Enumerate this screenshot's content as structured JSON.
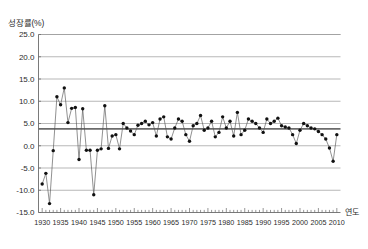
{
  "chart_data": {
    "type": "line",
    "title": "",
    "ylabel": "성장률(%)",
    "xlabel": "연도",
    "ylim": [
      -15.0,
      25.0
    ],
    "xlim": [
      1929,
      2011
    ],
    "grid": true,
    "legend": false,
    "yticks": [
      "25.0",
      "20.0",
      "15.0",
      "10.0",
      "5.0",
      "0.0",
      "-5.0",
      "-10.0",
      "-15.0"
    ],
    "ytick_values": [
      25.0,
      20.0,
      15.0,
      10.0,
      5.0,
      0.0,
      -5.0,
      -10.0,
      -15.0
    ],
    "xticks": [
      "1930",
      "1935",
      "1940",
      "1945",
      "1950",
      "1955",
      "1960",
      "1965",
      "1970",
      "1975",
      "1980",
      "1985",
      "1990",
      "1995",
      "2000",
      "2005",
      "2010"
    ],
    "xtick_values": [
      1930,
      1935,
      1940,
      1945,
      1950,
      1955,
      1960,
      1965,
      1970,
      1975,
      1980,
      1985,
      1990,
      1995,
      2000,
      2005,
      2010
    ],
    "reference_line": {
      "value": 3.8,
      "label": ""
    },
    "marker": "filled-circle",
    "series": [
      {
        "name": "성장률",
        "color": "#111111",
        "x": [
          1930,
          1931,
          1932,
          1933,
          1934,
          1935,
          1936,
          1937,
          1938,
          1939,
          1940,
          1941,
          1942,
          1943,
          1944,
          1945,
          1946,
          1947,
          1948,
          1949,
          1950,
          1951,
          1952,
          1953,
          1954,
          1955,
          1956,
          1957,
          1958,
          1959,
          1960,
          1961,
          1962,
          1963,
          1964,
          1965,
          1966,
          1967,
          1968,
          1969,
          1970,
          1971,
          1972,
          1973,
          1974,
          1975,
          1976,
          1977,
          1978,
          1979,
          1980,
          1981,
          1982,
          1983,
          1984,
          1985,
          1986,
          1987,
          1988,
          1989,
          1990,
          1991,
          1992,
          1993,
          1994,
          1995,
          1996,
          1997,
          1998,
          1999,
          2000,
          2001,
          2002,
          2003,
          2004,
          2005,
          2006,
          2007,
          2008,
          2009,
          2010
        ],
        "values": [
          -8.6,
          -6.2,
          -13.0,
          -1.1,
          11.0,
          9.2,
          13.0,
          5.2,
          8.4,
          8.6,
          -3.1,
          8.3,
          -1.0,
          -1.0,
          -11.0,
          -1.0,
          -0.7,
          9.0,
          -0.6,
          2.2,
          2.5,
          -0.7,
          5.0,
          4.0,
          3.3,
          2.5,
          4.6,
          5.0,
          5.5,
          4.7,
          5.2,
          2.2,
          6.0,
          6.5,
          2.0,
          1.5,
          4.0,
          6.0,
          5.5,
          2.5,
          1.0,
          4.5,
          5.0,
          6.8,
          3.5,
          4.0,
          5.5,
          2.0,
          3.0,
          6.5,
          4.0,
          5.5,
          2.2,
          7.5,
          2.5,
          3.5,
          6.0,
          5.5,
          5.0,
          4.0,
          3.0,
          6.0,
          5.0,
          5.5,
          6.2,
          4.5,
          4.2,
          4.0,
          2.5,
          0.5,
          3.5,
          5.0,
          4.5,
          4.0,
          3.8,
          3.2,
          2.5,
          1.5,
          -0.5,
          -3.5,
          2.5
        ]
      }
    ]
  }
}
